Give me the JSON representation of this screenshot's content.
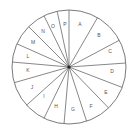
{
  "diagram": {
    "type": "segmented-wheel",
    "center": [
      69,
      67
    ],
    "radius": 57,
    "line_color": "#7a7a7a",
    "hub_color": "#222222",
    "spoke_angles_deg": [
      0,
      30,
      62,
      86,
      111,
      136,
      162,
      185,
      206,
      228,
      254,
      275,
      294,
      315,
      334,
      348
    ],
    "segments": [
      {
        "label": "A",
        "pos": [
          80,
          25
        ]
      },
      {
        "label": "B",
        "pos": [
          99,
          36
        ]
      },
      {
        "label": "C",
        "pos": [
          110,
          52
        ]
      },
      {
        "label": "D",
        "pos": [
          112,
          72
        ]
      },
      {
        "label": "E",
        "pos": [
          106,
          93
        ]
      },
      {
        "label": "F",
        "pos": [
          91,
          107
        ]
      },
      {
        "label": "G",
        "pos": [
          73,
          110
        ]
      },
      {
        "label": "H",
        "pos": [
          56,
          107
        ]
      },
      {
        "label": "I",
        "pos": [
          44,
          97
        ]
      },
      {
        "label": "J",
        "pos": [
          32,
          88
        ]
      },
      {
        "label": "K",
        "pos": [
          28,
          71
        ]
      },
      {
        "label": "L",
        "pos": [
          28,
          57
        ]
      },
      {
        "label": "M",
        "pos": [
          33,
          43
        ]
      },
      {
        "label": "N",
        "pos": [
          43,
          32
        ]
      },
      {
        "label": "O",
        "pos": [
          53,
          27
        ]
      },
      {
        "label": "P",
        "pos": [
          65,
          25
        ]
      }
    ]
  }
}
